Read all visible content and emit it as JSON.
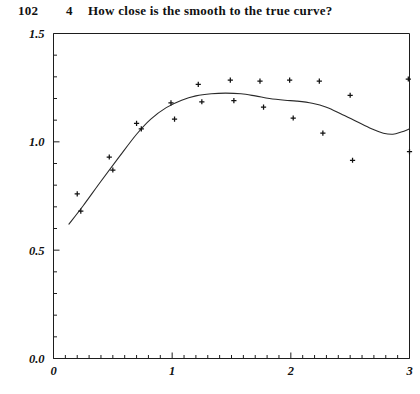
{
  "header": {
    "page_number": "102",
    "chapter_number": "4",
    "chapter_title": "How close is the smooth to the true curve?"
  },
  "chart_data": {
    "type": "scatter",
    "title": "",
    "subtitle": "",
    "xlabel": "",
    "ylabel": "",
    "xlim": [
      0,
      3
    ],
    "ylim": [
      0,
      1.5
    ],
    "grid": false,
    "legend": null,
    "x_ticks": [
      0,
      1,
      2,
      3
    ],
    "x_tick_labels": [
      "0",
      "1",
      "2",
      "3"
    ],
    "x_minor_tick_step": 0.1,
    "y_ticks": [
      0.0,
      0.5,
      1.0,
      1.5
    ],
    "y_tick_labels": [
      "0.0",
      "0.5",
      "1.0",
      "1.5"
    ],
    "y_minor_tick_step": 0.1,
    "frame": "box",
    "marker": "plus",
    "marker_color": "#111111",
    "line_color": "#2a2a2a",
    "series": [
      {
        "name": "observations",
        "type": "scatter",
        "marker": "plus",
        "points": [
          [
            0.2,
            0.76
          ],
          [
            0.23,
            0.68
          ],
          [
            0.47,
            0.93
          ],
          [
            0.5,
            0.87
          ],
          [
            0.7,
            1.085
          ],
          [
            0.74,
            1.06
          ],
          [
            0.99,
            1.18
          ],
          [
            1.02,
            1.105
          ],
          [
            1.22,
            1.265
          ],
          [
            1.25,
            1.185
          ],
          [
            1.49,
            1.285
          ],
          [
            1.52,
            1.19
          ],
          [
            1.74,
            1.28
          ],
          [
            1.77,
            1.16
          ],
          [
            1.99,
            1.285
          ],
          [
            2.02,
            1.11
          ],
          [
            2.24,
            1.28
          ],
          [
            2.27,
            1.04
          ],
          [
            2.5,
            1.215
          ],
          [
            2.52,
            0.915
          ],
          [
            2.99,
            1.29
          ],
          [
            3.0,
            0.955
          ]
        ]
      },
      {
        "name": "smooth",
        "type": "line",
        "points": [
          [
            0.13,
            0.62
          ],
          [
            0.25,
            0.705
          ],
          [
            0.4,
            0.818
          ],
          [
            0.55,
            0.928
          ],
          [
            0.7,
            1.035
          ],
          [
            0.82,
            1.105
          ],
          [
            0.95,
            1.158
          ],
          [
            1.08,
            1.192
          ],
          [
            1.2,
            1.212
          ],
          [
            1.33,
            1.222
          ],
          [
            1.45,
            1.225
          ],
          [
            1.58,
            1.222
          ],
          [
            1.7,
            1.212
          ],
          [
            1.82,
            1.2
          ],
          [
            1.95,
            1.192
          ],
          [
            2.05,
            1.188
          ],
          [
            2.18,
            1.178
          ],
          [
            2.3,
            1.16
          ],
          [
            2.42,
            1.13
          ],
          [
            2.55,
            1.095
          ],
          [
            2.68,
            1.06
          ],
          [
            2.78,
            1.04
          ],
          [
            2.86,
            1.035
          ],
          [
            2.93,
            1.045
          ],
          [
            3.0,
            1.06
          ]
        ]
      }
    ]
  }
}
